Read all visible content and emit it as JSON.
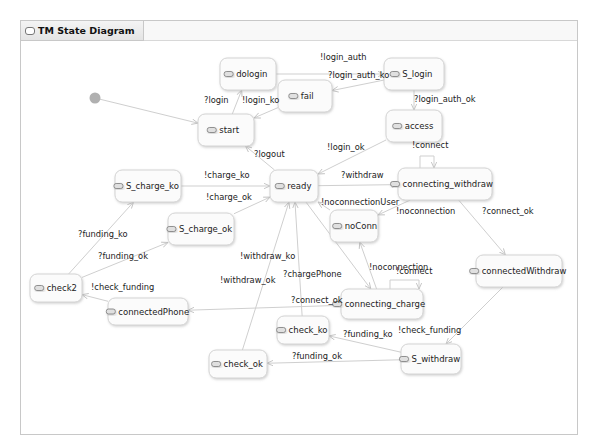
{
  "window": {
    "tab_title": "TM State Diagram"
  },
  "diagram": {
    "initial": {
      "name": "initial-state",
      "x": 95,
      "y": 98
    },
    "states": [
      {
        "id": "dologin",
        "label": "dologin",
        "x": 220,
        "y": 58,
        "w": 56,
        "h": 32
      },
      {
        "id": "S_login",
        "label": "S_login",
        "x": 384,
        "y": 58,
        "w": 60,
        "h": 32
      },
      {
        "id": "fail",
        "label": "fail",
        "x": 278,
        "y": 80,
        "w": 54,
        "h": 32
      },
      {
        "id": "access",
        "label": "access",
        "x": 386,
        "y": 110,
        "w": 56,
        "h": 32
      },
      {
        "id": "start",
        "label": "start",
        "x": 198,
        "y": 114,
        "w": 56,
        "h": 32
      },
      {
        "id": "S_charge_ko",
        "label": "S_charge_ko",
        "x": 115,
        "y": 170,
        "w": 66,
        "h": 32
      },
      {
        "id": "ready",
        "label": "ready",
        "x": 270,
        "y": 170,
        "w": 48,
        "h": 32
      },
      {
        "id": "connecting_withdraw",
        "label": "connecting_withdraw",
        "x": 398,
        "y": 168,
        "w": 94,
        "h": 32
      },
      {
        "id": "S_charge_ok",
        "label": "S_charge_ok",
        "x": 168,
        "y": 213,
        "w": 66,
        "h": 32
      },
      {
        "id": "noConn",
        "label": "noConn",
        "x": 330,
        "y": 210,
        "w": 48,
        "h": 32
      },
      {
        "id": "check2",
        "label": "check2",
        "x": 30,
        "y": 274,
        "w": 52,
        "h": 28
      },
      {
        "id": "connectedWithdraw",
        "label": "connectedWithdraw",
        "x": 476,
        "y": 255,
        "w": 86,
        "h": 32
      },
      {
        "id": "connecting_charge",
        "label": "connecting_charge",
        "x": 341,
        "y": 289,
        "w": 82,
        "h": 30
      },
      {
        "id": "connectedPhone",
        "label": "connectedPhone",
        "x": 108,
        "y": 298,
        "w": 80,
        "h": 27
      },
      {
        "id": "check_ko",
        "label": "check_ko",
        "x": 277,
        "y": 316,
        "w": 52,
        "h": 28
      },
      {
        "id": "S_withdraw",
        "label": "S_withdraw",
        "x": 401,
        "y": 344,
        "w": 60,
        "h": 30
      },
      {
        "id": "check_ok",
        "label": "check_ok",
        "x": 209,
        "y": 350,
        "w": 58,
        "h": 28
      }
    ],
    "transitions": [
      {
        "id": "t-init-start",
        "label": "",
        "from": "initial",
        "to": "start"
      },
      {
        "id": "t-start-dologin",
        "label": "?login",
        "from": "start",
        "to": "dologin"
      },
      {
        "id": "t-dologin-slogin",
        "label": "!login_auth",
        "from": "dologin",
        "to": "S_login"
      },
      {
        "id": "t-slogin-fail",
        "label": "?login_auth_ko",
        "from": "S_login",
        "to": "fail"
      },
      {
        "id": "t-fail-start",
        "label": "!login_ko",
        "from": "fail",
        "to": "start"
      },
      {
        "id": "t-slogin-access",
        "label": "?login_auth_ok",
        "from": "S_login",
        "to": "access"
      },
      {
        "id": "t-access-ready",
        "label": "!login_ok",
        "from": "access",
        "to": "ready"
      },
      {
        "id": "t-ready-start",
        "label": "?logout",
        "from": "ready",
        "to": "start"
      },
      {
        "id": "t-schargeko-ready",
        "label": "!charge_ko",
        "from": "S_charge_ko",
        "to": "ready"
      },
      {
        "id": "t-schargeok-ready",
        "label": "!charge_ok",
        "from": "S_charge_ok",
        "to": "ready"
      },
      {
        "id": "t-ready-cw",
        "label": "?withdraw",
        "from": "ready",
        "to": "connecting_withdraw"
      },
      {
        "id": "t-cw-self",
        "label": "!connect",
        "from": "connecting_withdraw",
        "to": "connecting_withdraw"
      },
      {
        "id": "t-noconn-ready",
        "label": "!noconnectionUser",
        "from": "noConn",
        "to": "ready"
      },
      {
        "id": "t-cw-noconn",
        "label": "!noconnection",
        "from": "connecting_withdraw",
        "to": "noConn"
      },
      {
        "id": "t-cw-connected",
        "label": "?connect_ok",
        "from": "connecting_withdraw",
        "to": "connectedWithdraw"
      },
      {
        "id": "t-check2-schargeko",
        "label": "?funding_ko",
        "from": "check2",
        "to": "S_charge_ko"
      },
      {
        "id": "t-check2-schargeok",
        "label": "?funding_ok",
        "from": "check2",
        "to": "S_charge_ok"
      },
      {
        "id": "t-cp-check2",
        "label": "!check_funding",
        "from": "connectedPhone",
        "to": "check2"
      },
      {
        "id": "t-ready-cc",
        "label": "?chargePhone",
        "from": "ready",
        "to": "connecting_charge"
      },
      {
        "id": "t-cc-noconn",
        "label": "!noconnection",
        "from": "connecting_charge",
        "to": "noConn"
      },
      {
        "id": "t-cc-self",
        "label": "!connect",
        "from": "connecting_charge",
        "to": "connecting_charge"
      },
      {
        "id": "t-cc-cp",
        "label": "?connect_ok",
        "from": "connecting_charge",
        "to": "connectedPhone"
      },
      {
        "id": "t-checkko-ready",
        "label": "!withdraw_ko",
        "from": "check_ko",
        "to": "ready"
      },
      {
        "id": "t-checkok-ready",
        "label": "!withdraw_ok",
        "from": "check_ok",
        "to": "ready"
      },
      {
        "id": "t-cwd-sw",
        "label": "!check_funding",
        "from": "connectedWithdraw",
        "to": "S_withdraw"
      },
      {
        "id": "t-sw-checkko",
        "label": "?funding_ko",
        "from": "S_withdraw",
        "to": "check_ko"
      },
      {
        "id": "t-sw-checkok",
        "label": "?funding_ok",
        "from": "S_withdraw",
        "to": "check_ok"
      }
    ]
  }
}
